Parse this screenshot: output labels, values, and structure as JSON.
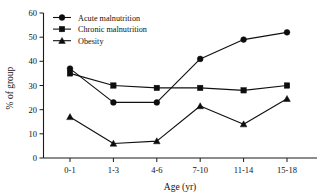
{
  "chart_data": {
    "type": "line",
    "title": "",
    "xlabel": "Age (yr)",
    "ylabel": "% of group",
    "categories": [
      "0-1",
      "1-3",
      "4-6",
      "7-10",
      "11-14",
      "15-18"
    ],
    "ylim": [
      0,
      60
    ],
    "yticks": [
      0,
      10,
      20,
      30,
      40,
      50,
      60
    ],
    "ytick_labels": [
      "0",
      "10",
      "20",
      "30",
      "40",
      "50",
      "60"
    ],
    "grid": false,
    "legend_position": "top-left inside plot area",
    "series": [
      {
        "name": "Acute malnutrition",
        "marker": "circle",
        "values": [
          37,
          23,
          23,
          41,
          49,
          52
        ]
      },
      {
        "name": "Chronic malnutrition",
        "marker": "square",
        "values": [
          35,
          30,
          29,
          29,
          28,
          30
        ]
      },
      {
        "name": "Obesity",
        "marker": "triangle",
        "values": [
          17,
          6,
          7,
          21.5,
          14,
          24.5
        ]
      }
    ]
  },
  "legend": {
    "entries": [
      {
        "label": "Acute malnutrition",
        "marker": "circle-marker-icon"
      },
      {
        "label": "Chronic malnutrition",
        "marker": "square-marker-icon"
      },
      {
        "label": "Obesity",
        "marker": "triangle-marker-icon"
      }
    ]
  },
  "axes": {
    "y_title": "% of group",
    "x_title": "Age (yr)",
    "y_labels": [
      "60",
      "50",
      "40",
      "30",
      "20",
      "10",
      "0"
    ],
    "x_labels": [
      "0-1",
      "1-3",
      "4-6",
      "7-10",
      "11-14",
      "15-18"
    ]
  },
  "colors": {
    "ink": "#101010",
    "background": "#ffffff"
  }
}
